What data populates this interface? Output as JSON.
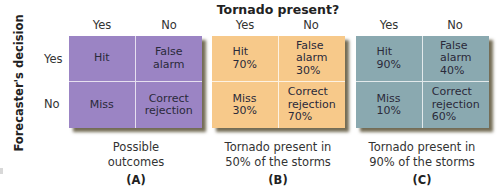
{
  "title": "Tornado present?",
  "column_headers": [
    "Yes",
    "No"
  ],
  "row_axis_label": "Forecaster's decision",
  "row_headers": [
    "Yes",
    "No"
  ],
  "colors": {
    "panel_a": "#9b84c4",
    "panel_b": "#f7c98a",
    "panel_c": "#8aa9b0",
    "divider": "#ffffff",
    "shadow": "#6b5e36"
  },
  "panels": [
    {
      "id": "A",
      "letter": "(A)",
      "caption": [
        "Possible",
        "outcomes"
      ],
      "cells": {
        "hit": "Hit",
        "false_alarm": "False\nalarm",
        "miss": "Miss",
        "correct_rejection": "Correct\nrejection"
      }
    },
    {
      "id": "B",
      "letter": "(B)",
      "caption": [
        "Tornado present in",
        "50% of the storms"
      ],
      "cells": {
        "hit": "Hit\n70%",
        "false_alarm": "False\nalarm\n30%",
        "miss": "Miss\n30%",
        "correct_rejection": "Correct\nrejection\n70%"
      }
    },
    {
      "id": "C",
      "letter": "(C)",
      "caption": [
        "Tornado present in",
        "90% of the storms"
      ],
      "cells": {
        "hit": "Hit\n90%",
        "false_alarm": "False\nalarm\n40%",
        "miss": "Miss\n10%",
        "correct_rejection": "Correct\nrejection\n60%"
      }
    }
  ]
}
